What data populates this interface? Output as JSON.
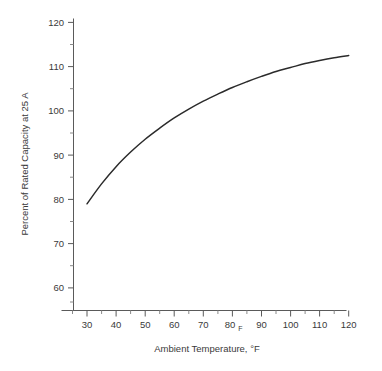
{
  "chart_data": {
    "type": "line",
    "title": "",
    "xlabel": "Ambient Temperature, °F",
    "ylabel": "Percent of Rated Capacity at 25 A",
    "xlim": [
      25,
      123
    ],
    "ylim": [
      55,
      121
    ],
    "grid": false,
    "legend": null,
    "x_ticks": [
      30,
      40,
      50,
      60,
      70,
      80,
      90,
      100,
      110,
      120
    ],
    "x_tick_labels": [
      "30",
      "40",
      "50",
      "60",
      "70",
      "80",
      "90",
      "100",
      "110",
      "120"
    ],
    "x_minor_step": 5,
    "y_ticks": [
      60,
      70,
      80,
      90,
      100,
      110,
      120
    ],
    "y_tick_labels": [
      "60",
      "70",
      "80",
      "90",
      "100",
      "110",
      "120"
    ],
    "y_minor_step": 5,
    "stray_marks": [
      {
        "text": "F",
        "near_tick": "80",
        "note": "small F glyph adjacent to the 80 x-tick label"
      }
    ],
    "series": [
      {
        "name": "Percent of rated capacity at 25 A",
        "color": "#2b2b2b",
        "x": [
          30,
          35,
          40,
          45,
          50,
          55,
          60,
          65,
          70,
          75,
          80,
          85,
          90,
          95,
          100,
          105,
          110,
          115,
          120
        ],
        "y": [
          79.0,
          83.5,
          87.4,
          90.7,
          93.6,
          96.1,
          98.4,
          100.4,
          102.2,
          103.8,
          105.3,
          106.6,
          107.8,
          108.9,
          109.8,
          110.7,
          111.4,
          112.0,
          112.5
        ]
      }
    ]
  },
  "axes": {
    "x_label_text": "Ambient Temperature, ",
    "x_label_unit": "°F",
    "y_label_text": "Percent of Rated Capacity at 25 A",
    "stray_f": "F"
  }
}
